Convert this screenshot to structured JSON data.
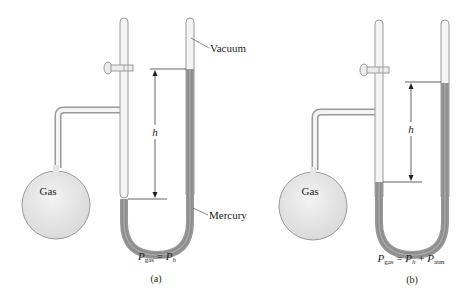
{
  "figure": {
    "panels": [
      {
        "id": "a",
        "caption": "(a)",
        "bulb_label": "Gas",
        "height_label": "h",
        "vacuum_label": "Vacuum",
        "mercury_label": "Mercury",
        "equation": {
          "lhs_symbol": "P",
          "lhs_sub": "gas",
          "eq": " = ",
          "rhs1_symbol": "P",
          "rhs1_sub": "h",
          "plus": "",
          "rhs2_symbol": "",
          "rhs2_sub": ""
        }
      },
      {
        "id": "b",
        "caption": "(b)",
        "bulb_label": "Gas",
        "height_label": "h",
        "equation": {
          "lhs_symbol": "P",
          "lhs_sub": "gas",
          "eq": " = ",
          "rhs1_symbol": "P",
          "rhs1_sub": "h",
          "plus": " + ",
          "rhs2_symbol": "P",
          "rhs2_sub": "atm"
        }
      }
    ],
    "colors": {
      "glass_outline": "#9a9a9a",
      "glass_fill": "#f4f4f4",
      "mercury": "#8c8c8c",
      "bulb_fill": "#e6e6e6",
      "text": "#231f20"
    }
  }
}
